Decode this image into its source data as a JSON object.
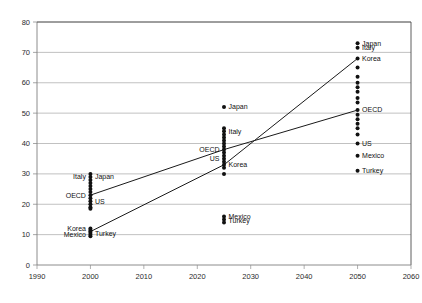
{
  "chart_data": {
    "type": "scatter",
    "title": "",
    "subtitle": "",
    "xlabel": "",
    "ylabel": "",
    "xlim": [
      1990,
      2060
    ],
    "ylim": [
      0,
      80
    ],
    "xticks": [
      "1990",
      "2000",
      "2010",
      "2020",
      "2030",
      "2040",
      "2050",
      "2060"
    ],
    "yticks": [
      "0",
      "10",
      "20",
      "30",
      "40",
      "50",
      "60",
      "70",
      "80"
    ],
    "grid": "horizontal",
    "legend": "none",
    "x": [
      2000,
      2025,
      2050
    ],
    "clusters": [
      {
        "year": 2000,
        "values": [
          30.0,
          29.0,
          28.0,
          27.0,
          26.0,
          25.0,
          24.0,
          23.0,
          22.0,
          21.0,
          20.0,
          19.0,
          18.5,
          12.0,
          11.5,
          11.0,
          10.5,
          10.0,
          9.5
        ],
        "labels": [
          {
            "name": "Italy",
            "value": 29.0,
            "side": "left"
          },
          {
            "name": "Japan",
            "value": 29.0,
            "side": "right"
          },
          {
            "name": "OECD",
            "value": 23.0,
            "side": "left"
          },
          {
            "name": "US",
            "value": 21.0,
            "side": "right"
          },
          {
            "name": "Korea",
            "value": 12.0,
            "side": "left"
          },
          {
            "name": "Mexico",
            "value": 10.0,
            "side": "left"
          },
          {
            "name": "Turkey",
            "value": 10.5,
            "side": "right"
          }
        ]
      },
      {
        "year": 2025,
        "values": [
          52.0,
          45.0,
          44.0,
          43.0,
          42.0,
          41.0,
          40.0,
          39.0,
          38.0,
          37.0,
          36.0,
          35.0,
          34.0,
          33.0,
          32.0,
          30.0,
          16.0,
          15.0,
          14.0
        ],
        "labels": [
          {
            "name": "Japan",
            "value": 52.0,
            "side": "right"
          },
          {
            "name": "Italy",
            "value": 44.0,
            "side": "right"
          },
          {
            "name": "OECD",
            "value": 38.0,
            "side": "left"
          },
          {
            "name": "US",
            "value": 35.0,
            "side": "left"
          },
          {
            "name": "Korea",
            "value": 33.0,
            "side": "right"
          },
          {
            "name": "Mexico",
            "value": 16.0,
            "side": "right"
          },
          {
            "name": "Turkey",
            "value": 14.5,
            "side": "right"
          }
        ]
      },
      {
        "year": 2050,
        "values": [
          73.0,
          71.5,
          68.0,
          65.0,
          62.0,
          60.0,
          58.5,
          57.0,
          55.0,
          53.5,
          51.0,
          49.5,
          48.0,
          46.5,
          45.0,
          43.0,
          40.0,
          36.0,
          31.0
        ],
        "labels": [
          {
            "name": "Japan",
            "value": 73.0,
            "side": "right"
          },
          {
            "name": "Italy",
            "value": 71.5,
            "side": "right"
          },
          {
            "name": "Korea",
            "value": 68.0,
            "side": "right"
          },
          {
            "name": "OECD",
            "value": 51.0,
            "side": "right"
          },
          {
            "name": "US",
            "value": 40.0,
            "side": "right"
          },
          {
            "name": "Mexico",
            "value": 36.0,
            "side": "right"
          },
          {
            "name": "Turkey",
            "value": 31.0,
            "side": "right"
          }
        ]
      }
    ],
    "series": [
      {
        "name": "OECD",
        "x": [
          2000,
          2025,
          2050
        ],
        "values": [
          23.0,
          38.0,
          51.0
        ]
      },
      {
        "name": "Korea",
        "x": [
          2000,
          2025,
          2050
        ],
        "values": [
          11.0,
          33.0,
          68.0
        ]
      }
    ]
  }
}
